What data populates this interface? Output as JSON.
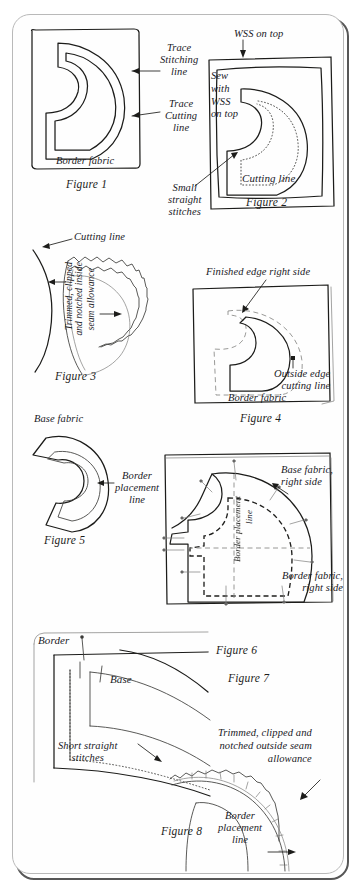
{
  "document": {
    "kind": "sewing instruction illustration page",
    "figure_count": 8
  },
  "figures": [
    {
      "caption": "Figure 1",
      "labels": [
        "Trace\nStitching\nline",
        "Trace\nCutting\nline",
        "Border fabric"
      ]
    },
    {
      "caption": "Figure 2",
      "labels": [
        "WSS on top",
        "Sew\nwith\nWSS\non top",
        "Cutting line",
        "Small\nstraight\nstitches"
      ]
    },
    {
      "caption": "Figure 3",
      "labels": [
        "Cutting line",
        "Trimmed, clipped",
        "and notched inside",
        "seam allowance"
      ]
    },
    {
      "caption": "Figure 4",
      "labels": [
        "Finished edge right side",
        "Outside edge\ncutting line",
        "Border fabric"
      ]
    },
    {
      "caption": "Figure 5",
      "labels": [
        "Base fabric",
        "Border\nplacement\nline"
      ]
    },
    {
      "caption": "Figure 6",
      "labels": [
        "Base fabric,\nright side",
        "Border placement",
        "line",
        "Border fabric,\nright side"
      ]
    },
    {
      "caption": "Figure 7",
      "labels": [
        "Border",
        "Base",
        "Short straight\nstitches"
      ]
    },
    {
      "caption": "Figure 8",
      "labels": [
        "Trimmed, clipped and\nnotched outside seam\nallowance",
        "Border\nplacement\nline"
      ]
    }
  ],
  "colors": {
    "ink": "#1c1c1a",
    "paper": "#fefefe",
    "light_ink": "#7d7d7b",
    "sheet_border": "#3a3a3a"
  }
}
